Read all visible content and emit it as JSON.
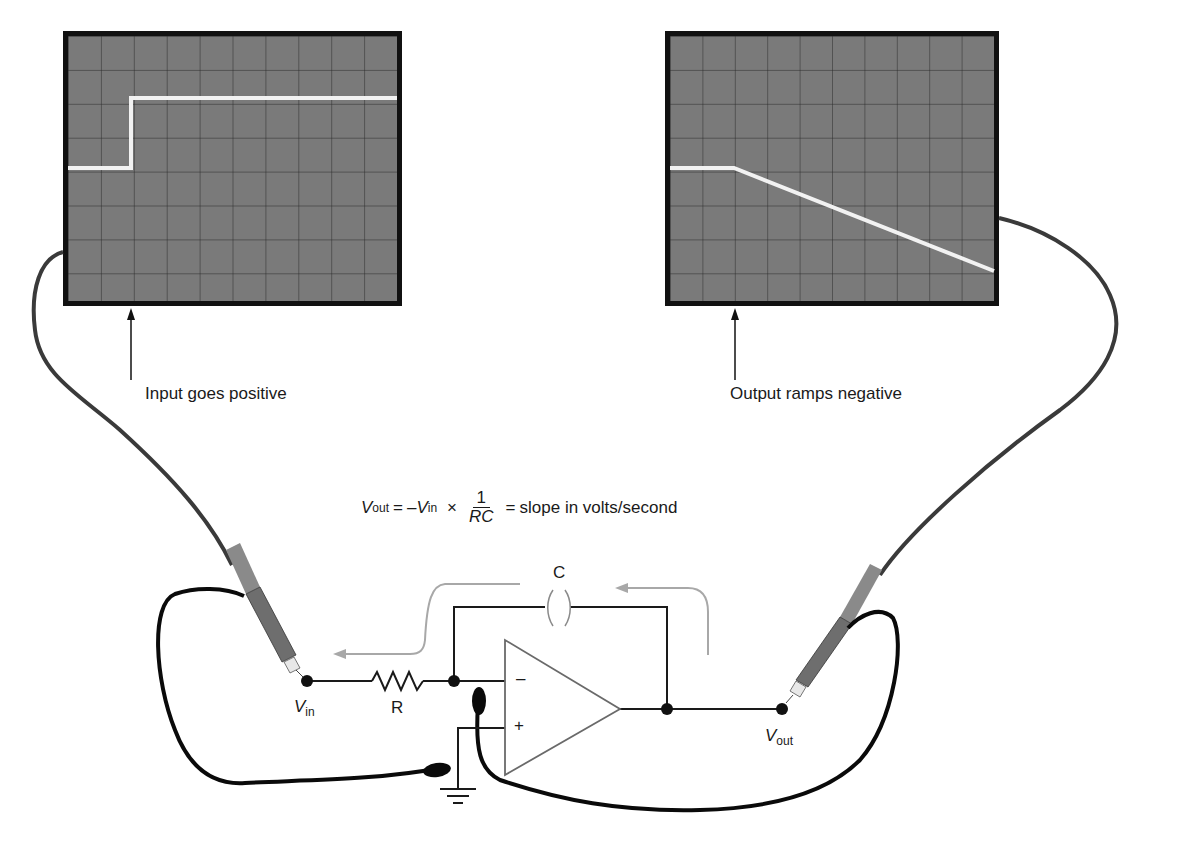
{
  "figure": {
    "input_scope": {
      "label": "Input goes positive",
      "grid": {
        "columns": 10,
        "rows": 8
      },
      "trace": "step: low level at 5th division from top, rising at 2nd column line to 2nd division from top"
    },
    "output_scope": {
      "label": "Output ramps negative",
      "grid": {
        "columns": 10,
        "rows": 8
      },
      "trace": "flat at 5th division until 2nd column line, then linear ramp down to ~7th division at right edge"
    },
    "formula": {
      "vout": "V",
      "vout_sub": "out",
      "equals1": "=",
      "minus_vin": "–V",
      "vin_sub": "in",
      "times": "×",
      "numerator": "1",
      "denominator": "RC",
      "equals2": "=",
      "result": "slope in volts/second"
    },
    "circuit": {
      "capacitor_label": "C",
      "resistor_label": "R",
      "vin_label": "V",
      "vin_sub": "in",
      "vout_label": "V",
      "vout_sub": "out",
      "opamp_minus": "–",
      "opamp_plus": "+"
    },
    "colors": {
      "screen": "#7a7a7a",
      "frame": "#111111",
      "grid": "#2a2a2a",
      "trace": "#f2f2f2",
      "flow_arrow": "#a8a8a8",
      "probe_body": "#6e6e6e"
    }
  }
}
